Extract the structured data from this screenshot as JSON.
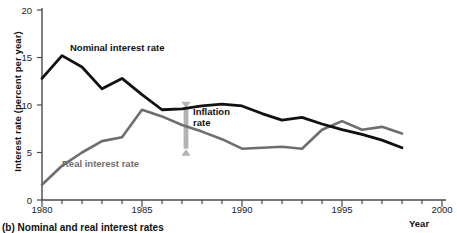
{
  "chart_data": {
    "type": "line",
    "title": "",
    "xlabel": "Year",
    "ylabel": "Interest rate (percent per year)",
    "xlim": [
      1980,
      2000
    ],
    "ylim": [
      0,
      20
    ],
    "yticks": [
      0,
      5,
      10,
      15,
      20
    ],
    "xticks": [
      1980,
      1985,
      1990,
      1995,
      2000
    ],
    "xminor_tick_interval": 1,
    "grid": false,
    "legend": "inline-labels",
    "x": [
      1980,
      1981,
      1982,
      1983,
      1984,
      1985,
      1986,
      1987,
      1988,
      1989,
      1990,
      1991,
      1992,
      1993,
      1994,
      1995,
      1996,
      1997,
      1998
    ],
    "series": [
      {
        "name": "Nominal interest rate",
        "color": "#111111",
        "values": [
          12.8,
          15.2,
          14.0,
          11.7,
          12.8,
          11.1,
          9.5,
          9.6,
          9.9,
          10.1,
          9.9,
          9.1,
          8.4,
          8.7,
          8.0,
          7.4,
          6.9,
          6.3,
          5.5
        ]
      },
      {
        "name": "Real interest rate",
        "color": "#6e6e6e",
        "values": [
          1.6,
          3.6,
          5.0,
          6.2,
          6.6,
          9.5,
          8.8,
          7.9,
          7.2,
          6.4,
          5.4,
          5.5,
          5.6,
          5.4,
          7.4,
          8.3,
          7.4,
          7.7,
          7.0
        ]
      }
    ],
    "annotations": [
      {
        "name": "inflation-rate-gap",
        "label": "Inflation rate",
        "type": "double-headed-arrow",
        "color": "#b3b3b3",
        "x": 1987.2,
        "y_from": 5.4,
        "y_to": 9.6
      }
    ]
  },
  "axes": {
    "ylabel": "Interest rate (percent per year)",
    "xlabel": "Year",
    "ytick_labels": [
      "20",
      "15",
      "10",
      "5",
      "0"
    ],
    "xtick_labels": [
      "1980",
      "1985",
      "1990",
      "1995",
      "2000"
    ]
  },
  "labels": {
    "nominal": "Nominal interest rate",
    "real": "Real interest rate",
    "inflation_line1": "Inflation",
    "inflation_line2": "rate"
  },
  "caption": {
    "text": "(b) Nominal and real interest rates"
  },
  "colors": {
    "nominal_line": "#111111",
    "real_line": "#6e6e6e",
    "arrow": "#b3b3b3",
    "axis": "#4a4a4a",
    "background": "#ffffff"
  }
}
